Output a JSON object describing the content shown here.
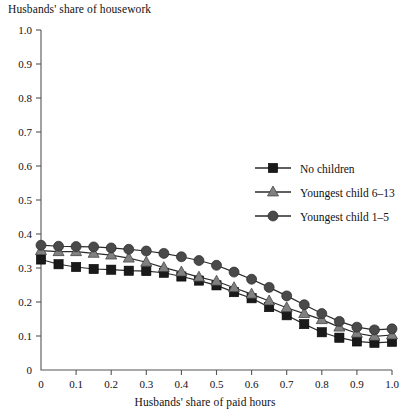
{
  "chart_data": {
    "type": "line",
    "title": "",
    "ylabel": "Husbands' share of housework",
    "xlabel": "Husbands' share of paid hours",
    "xlim": [
      0,
      1.0
    ],
    "ylim": [
      0,
      1.0
    ],
    "grid": false,
    "legend_position": "upper-right-inside",
    "x_ticks": [
      "0",
      "0.1",
      "0.2",
      "0.3",
      "0.4",
      "0.5",
      "0.6",
      "0.7",
      "0.8",
      "0.9",
      "1.0"
    ],
    "y_ticks": [
      "0",
      "0.1",
      "0.2",
      "0.3",
      "0.4",
      "0.5",
      "0.6",
      "0.7",
      "0.8",
      "0.9",
      "1.0"
    ],
    "x": [
      0,
      0.05,
      0.1,
      0.15,
      0.2,
      0.25,
      0.3,
      0.35,
      0.4,
      0.45,
      0.5,
      0.55,
      0.6,
      0.65,
      0.7,
      0.75,
      0.8,
      0.85,
      0.9,
      0.95,
      1.0
    ],
    "series": [
      {
        "name": "No children",
        "marker": "square",
        "color": "#1a1a1a",
        "values": [
          0.325,
          0.311,
          0.303,
          0.297,
          0.295,
          0.292,
          0.291,
          0.286,
          0.275,
          0.263,
          0.249,
          0.229,
          0.211,
          0.185,
          0.161,
          0.135,
          0.111,
          0.095,
          0.084,
          0.08,
          0.083
        ]
      },
      {
        "name": "Youngest child 6–13",
        "marker": "triangle",
        "color": "#808080",
        "values": [
          0.351,
          0.348,
          0.348,
          0.343,
          0.338,
          0.329,
          0.317,
          0.301,
          0.288,
          0.273,
          0.261,
          0.242,
          0.223,
          0.203,
          0.183,
          0.166,
          0.148,
          0.126,
          0.108,
          0.099,
          0.103
        ]
      },
      {
        "name": "Youngest child 1–5",
        "marker": "circle",
        "color": "#4a4a4a",
        "values": [
          0.367,
          0.364,
          0.363,
          0.362,
          0.359,
          0.355,
          0.35,
          0.343,
          0.333,
          0.322,
          0.308,
          0.288,
          0.267,
          0.243,
          0.218,
          0.192,
          0.166,
          0.143,
          0.126,
          0.118,
          0.121
        ]
      }
    ]
  },
  "legend": {
    "items": [
      {
        "label": "No children"
      },
      {
        "label": "Youngest child 6–13"
      },
      {
        "label": "Youngest child 1–5"
      }
    ]
  }
}
